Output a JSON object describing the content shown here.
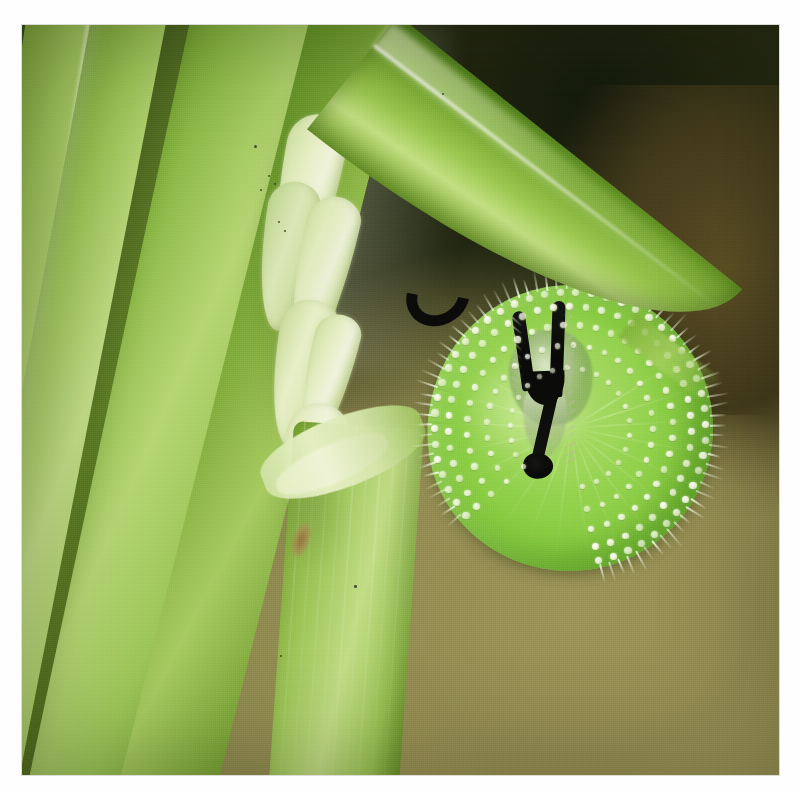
{
  "image": {
    "kind": "natural-photograph",
    "subject": "green slug caterpillar coiled on a rice plant leaf",
    "caption": "",
    "frame": {
      "left": 22,
      "top": 25,
      "width": 757,
      "height": 750
    },
    "page_background": "#fefefe"
  },
  "palette": {
    "page_white": "#fefefe",
    "background_olive": "#9a9357",
    "background_dark_olive": "#1e230f",
    "background_warm_brown": "#5c4f26",
    "leaf_dark_green": "#2b3d17",
    "leaf_mid_green": "#6f9a2c",
    "leaf_bright_green": "#a7cb60",
    "leaf_pale_green": "#c3de86",
    "grain_cream": "#f0f3dc",
    "grain_pale_green": "#cfe0a0",
    "caterpillar_green": "#8ccf46",
    "caterpillar_highlight": "#b9e07c",
    "caterpillar_edge_green": "#5eae27",
    "tubercle_white": "#ffffff",
    "horn_black": "#0b0b0a",
    "node_brown": "#8c6a38"
  },
  "scene": {
    "background": {
      "label": "blurred olive and dark-green bokeh background",
      "top_right_tone": "#1e230f",
      "bottom_right_tone": "#a59d5e",
      "mid_left_tone": "#4d4b24"
    },
    "left_plant": {
      "label": "rice plant stem with overlapping leaf blades",
      "blades": [
        {
          "name": "far dark blade",
          "tone": "#24340f"
        },
        {
          "name": "dark left blade",
          "tone": "#3b5a1d"
        },
        {
          "name": "pale blade one",
          "tone": "#bcd97d"
        },
        {
          "name": "pale blade two",
          "tone": "#c3de86"
        },
        {
          "name": "shadowed mid blade",
          "tone": "#55731f"
        },
        {
          "name": "main sheath blade",
          "tone": "#b6d673"
        },
        {
          "name": "right-of-stem blade",
          "tone": "#a7cb60"
        }
      ]
    },
    "panicle": {
      "label": "emerging rice panicle with swollen grain buds",
      "grain_count": 7,
      "tone": "#e6eec4"
    },
    "node": {
      "label": "leaf sheath node on the culm",
      "brown_spot_tone": "#8c6a38"
    },
    "cross_leaf": {
      "label": "leaf blade crossing diagonally over the caterpillar",
      "angle_degrees": 38,
      "tone": "#9ac84f"
    },
    "caterpillar": {
      "label": "slug caterpillar (Limacodidae) coiled in a flat spiral",
      "body_color": "#8ccf46",
      "highlight_color": "#b9e07c",
      "segment_seams": 22,
      "tubercle_rows": 5,
      "tubercle_color": "#ffffff",
      "spine_color": "#f0f8dc",
      "horns": {
        "count": 2,
        "color": "#0b0b0a",
        "shape": "wishbone / y-shaped black stemmed horns"
      },
      "center": {
        "x": 548,
        "y": 403
      },
      "diameter_px": 286
    }
  }
}
